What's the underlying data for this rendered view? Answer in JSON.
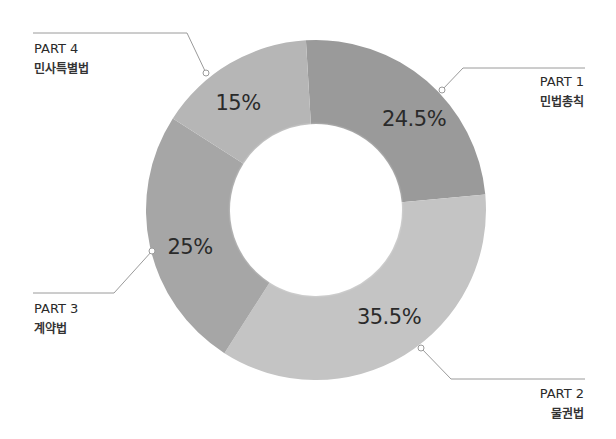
{
  "chart_data": {
    "type": "pie",
    "subtype": "donut",
    "title": "",
    "categories": [
      "PART 1 민법총칙",
      "PART 2 물권법",
      "PART 3 계약법",
      "PART 4 민사특별법"
    ],
    "values": [
      24.5,
      35.5,
      25,
      15
    ],
    "unit": "%",
    "segments": [
      {
        "part": "PART 1",
        "name": "민법총칙",
        "value": 24.5,
        "label": "24.5%",
        "color": "#9a9a9a"
      },
      {
        "part": "PART 2",
        "name": "물권법",
        "value": 35.5,
        "label": "35.5%",
        "color": "#c4c4c4"
      },
      {
        "part": "PART 3",
        "name": "계약법",
        "value": 25,
        "label": "25%",
        "color": "#a6a6a6"
      },
      {
        "part": "PART 4",
        "name": "민사특별법",
        "value": 15,
        "label": "15%",
        "color": "#b6b6b6"
      }
    ],
    "start_angle_deg": -3.4,
    "direction": "clockwise",
    "legend": "leader-line callouts"
  },
  "colors": {
    "background": "#ffffff",
    "leader_line": "#9a9a9a",
    "text": "#2a2a2a"
  }
}
